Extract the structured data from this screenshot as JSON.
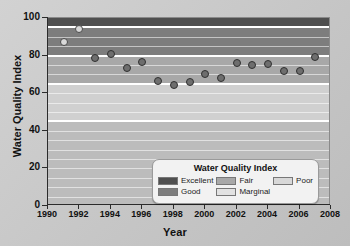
{
  "chart_data": {
    "type": "scatter",
    "title": "",
    "xlabel": "Year",
    "ylabel": "Water Quality Index",
    "xlim": [
      1990,
      2008
    ],
    "ylim": [
      0,
      100
    ],
    "grid": true,
    "legend_position": "inside-bottom-right",
    "x": [
      1991,
      1992,
      1993,
      1994,
      1995,
      1996,
      1997,
      1998,
      1999,
      2000,
      2001,
      2002,
      2003,
      2004,
      2005,
      2006,
      2007
    ],
    "values": [
      87,
      94,
      78.5,
      81,
      73.5,
      76.5,
      66.5,
      64.5,
      66,
      70,
      68,
      76,
      75,
      75.5,
      72,
      72,
      79.5
    ],
    "xticks": [
      "1990",
      "1992",
      "1994",
      "1996",
      "1998",
      "2000",
      "2002",
      "2004",
      "2006",
      "2008"
    ],
    "xtick_values": [
      1990,
      1992,
      1994,
      1996,
      1998,
      2000,
      2002,
      2004,
      2006,
      2008
    ],
    "yticks": [
      "0",
      "20",
      "40",
      "60",
      "80",
      "100"
    ],
    "ytick_values": [
      0,
      20,
      40,
      60,
      80,
      100
    ],
    "bands": [
      {
        "label": "Excellent",
        "min": 95,
        "max": 100,
        "color": "#4f4f4f"
      },
      {
        "label": "Good",
        "min": 80,
        "max": 95,
        "color": "#7d7d7d"
      },
      {
        "label": "Fair",
        "min": 65,
        "max": 80,
        "color": "#a8a8a8"
      },
      {
        "label": "Marginal",
        "min": 45,
        "max": 65,
        "color": "#d0d0d0"
      },
      {
        "label": "Poor",
        "min": 0,
        "max": 45,
        "color": "#bcbcbc"
      }
    ],
    "point_color": "#6e6e6e",
    "point_edge_color": "#303030"
  },
  "legend": {
    "title": "Water Quality Index",
    "items": [
      {
        "label": "Excellent",
        "color": "#4f4f4f"
      },
      {
        "label": "Good",
        "color": "#7d7d7d"
      },
      {
        "label": "Fair",
        "color": "#a8a8a8"
      },
      {
        "label": "Marginal",
        "color": "#e2e2e2"
      },
      {
        "label": "Poor",
        "color": "#d8d8d8"
      }
    ]
  }
}
